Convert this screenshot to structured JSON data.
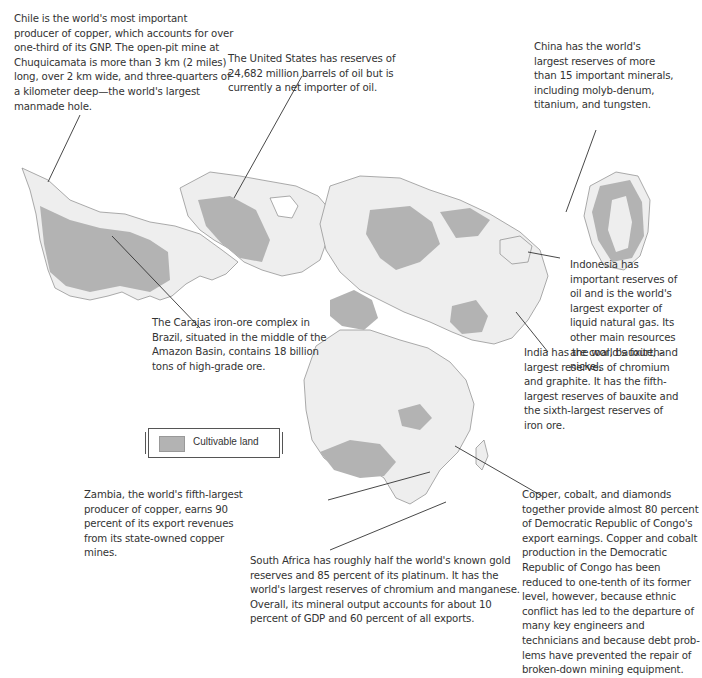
{
  "map": {
    "title": "",
    "colors": {
      "cultivable_land": "#b3b3b3",
      "other_land": "#eeeeee",
      "borders": "#666666",
      "leader_lines": "#333333"
    }
  },
  "legend": {
    "items": [
      {
        "label": "Cultivable land",
        "color": "#b3b3b3"
      }
    ]
  },
  "annotations": {
    "chile": "Chile is the world's most important producer of copper, which accounts for over one-third of its GNP. The open-pit mine at Chuquicamata is more than 3 km (2 miles) long, over 2 km wide, and three-quarters of a kilometer deep—the world's largest manmade hole.",
    "united_states": "The United States has reserves of 24,682 million barrels of oil but is currently a net importer of oil.",
    "china": "China has the world's largest reserves of more than 15 important minerals, including molyb-denum, titanium, and tungsten.",
    "indonesia": "Indonesia has important reserves of oil and is the world's largest exporter of liquid natural gas. Its other main resources are coal, bauxite, and nickel.",
    "brazil": "The Carajas iron-ore complex in Brazil, situated in the middle of the Amazon Basin, contains 18 billion tons of high-grade ore.",
    "india": "India has the world's fourth-largest reserves of chromium and graphite. It has the fifth-largest reserves of bauxite and the sixth-largest reserves of iron ore.",
    "zambia": "Zambia, the world's fifth-largest producer of copper, earns 90 percent of its export revenues from its state-owned copper mines.",
    "drc": "Copper, cobalt, and diamonds together provide almost 80 percent of Democratic Republic of Congo's export earnings. Copper and cobalt production in the Democratic Republic of Congo has been reduced to one-tenth of its former level, however, because ethnic conflict has led to the departure of many key engineers and technicians and because debt prob-lems have prevented the repair of broken-down mining equipment.",
    "south_africa": "South Africa has roughly half the world's known gold reserves and 85 percent of its platinum. It has the world's largest reserves of chromium and manganese. Overall, its mineral output accounts for about 10 percent of GDP and 60 percent of all exports."
  }
}
